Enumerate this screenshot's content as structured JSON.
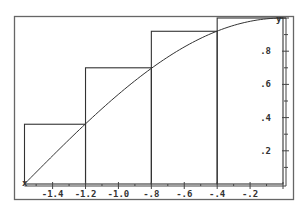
{
  "chart_data": {
    "type": "line",
    "title": "",
    "xlabel": "",
    "ylabel": "y",
    "xlim": [
      -1.5708,
      0
    ],
    "ylim": [
      0,
      1
    ],
    "grid": false,
    "legend": null,
    "curve": {
      "name": "y = cos(x)",
      "x": [
        -1.5708,
        -1.4,
        -1.2,
        -1.0,
        -0.8,
        -0.6,
        -0.4,
        -0.2,
        0.0
      ],
      "y": [
        0.0,
        0.17,
        0.36,
        0.54,
        0.7,
        0.83,
        0.92,
        0.98,
        1.0
      ]
    },
    "rectangles": [
      {
        "x_start": -1.5708,
        "x_end": -1.2,
        "height": 0.36
      },
      {
        "x_start": -1.2,
        "x_end": -0.8,
        "height": 0.7
      },
      {
        "x_start": -0.8,
        "x_end": -0.4,
        "height": 0.92
      },
      {
        "x_start": -0.4,
        "x_end": 0.0,
        "height": 1.0
      }
    ],
    "x_tick_labels": [
      "-1.4",
      "-1.2",
      "-1.0",
      "-.8",
      "-.6",
      "-.4",
      "-.2"
    ],
    "x_ticks": [
      -1.4,
      -1.2,
      -1.0,
      -0.8,
      -0.6,
      -0.4,
      -0.2
    ],
    "y_tick_labels": [
      ".2",
      ".4",
      ".6",
      ".8"
    ],
    "y_ticks": [
      0.2,
      0.4,
      0.6,
      0.8
    ],
    "y_axis_label": "y"
  },
  "colors": {
    "line": "#333333",
    "frame": "#555555",
    "background": "#ffffff"
  }
}
